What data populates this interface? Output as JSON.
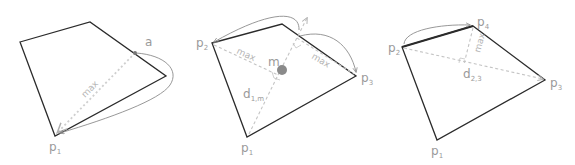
{
  "figure": {
    "panels": [
      {
        "id": "panel-1",
        "labels": {
          "point_a": "a",
          "point_p": "p",
          "point_p_sub": "1",
          "max": "max"
        }
      },
      {
        "id": "panel-2",
        "labels": {
          "p1": "p",
          "p1_sub": "1",
          "p2": "p",
          "p2_sub": "2",
          "p3": "p",
          "p3_sub": "3",
          "m": "m",
          "d": "d",
          "d_sub": "1,m",
          "max_left": "max",
          "max_right": "max"
        }
      },
      {
        "id": "panel-3",
        "labels": {
          "p1": "p",
          "p1_sub": "1",
          "p2": "p",
          "p2_sub": "2",
          "p3": "p",
          "p3_sub": "3",
          "p4": "p",
          "p4_sub": "4",
          "d": "d",
          "d_sub": "2,3",
          "max": "max"
        }
      }
    ],
    "colors": {
      "polygon_edge": "#2b2b2b",
      "dashed_guide": "#c4c4c4",
      "label": "#9a9a9a",
      "curve_arrow": "#8c8c8c",
      "centroid": "#8a8a8a"
    }
  }
}
